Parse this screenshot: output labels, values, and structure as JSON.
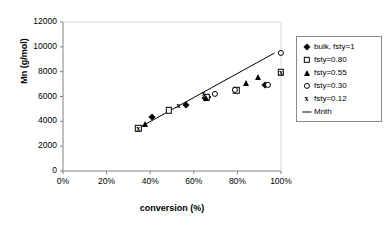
{
  "chart_data": {
    "type": "scatter",
    "title": "",
    "xlabel": "conversion (%)",
    "ylabel": "Mn (g/mol)",
    "xlim": [
      0,
      100
    ],
    "ylim": [
      0,
      12000
    ],
    "xticks": [
      "0%",
      "20%",
      "40%",
      "60%",
      "80%",
      "100%"
    ],
    "xtick_values": [
      0,
      20,
      40,
      60,
      80,
      100
    ],
    "yticks": [
      "0",
      "2000",
      "4000",
      "6000",
      "8000",
      "10000",
      "12000"
    ],
    "ytick_values": [
      0,
      2000,
      4000,
      6000,
      8000,
      10000,
      12000
    ],
    "grid": false,
    "legend_position": "right",
    "series": [
      {
        "name": "bulk, fsty=1",
        "marker": "filled-diamond",
        "points": [
          {
            "x": 41.0,
            "y": 4350
          },
          {
            "x": 56.5,
            "y": 5350
          },
          {
            "x": 65.0,
            "y": 5850
          },
          {
            "x": 66.5,
            "y": 6000
          },
          {
            "x": 92.5,
            "y": 6950
          }
        ]
      },
      {
        "name": "fsty=0.80",
        "marker": "open-square",
        "points": [
          {
            "x": 34.5,
            "y": 3450
          },
          {
            "x": 48.5,
            "y": 4900
          },
          {
            "x": 66.0,
            "y": 5950
          },
          {
            "x": 79.5,
            "y": 6500
          },
          {
            "x": 100.0,
            "y": 7950
          }
        ]
      },
      {
        "name": "fsty=0.55",
        "marker": "filled-triangle",
        "points": [
          {
            "x": 37.5,
            "y": 3800
          },
          {
            "x": 65.5,
            "y": 5900
          },
          {
            "x": 84.0,
            "y": 7050
          },
          {
            "x": 89.5,
            "y": 7600
          }
        ]
      },
      {
        "name": "fsty=0.30",
        "marker": "open-circle",
        "points": [
          {
            "x": 69.5,
            "y": 6200
          },
          {
            "x": 79.0,
            "y": 6550
          },
          {
            "x": 94.0,
            "y": 6950
          },
          {
            "x": 100.0,
            "y": 9500
          }
        ]
      },
      {
        "name": "fsty=0.12",
        "marker": "cross",
        "points": [
          {
            "x": 34.5,
            "y": 3400
          },
          {
            "x": 53.0,
            "y": 5250
          },
          {
            "x": 64.5,
            "y": 6200
          },
          {
            "x": 100.0,
            "y": 7900
          }
        ]
      }
    ],
    "trendline": {
      "name": "Mnth",
      "marker": "line",
      "x": [
        34.5,
        97.0
      ],
      "y": [
        3450,
        9500
      ]
    }
  },
  "legend": {
    "items": [
      {
        "label": "bulk, fsty=1",
        "marker": "filled-diamond"
      },
      {
        "label": "fsty=0.80",
        "marker": "open-square"
      },
      {
        "label": "fsty=0.55",
        "marker": "filled-triangle"
      },
      {
        "label": "fsty=0.30",
        "marker": "open-circle"
      },
      {
        "label": "fsty=0.12",
        "marker": "cross"
      },
      {
        "label": "Mnth",
        "marker": "line"
      }
    ]
  },
  "colors": {
    "ink": "#000000",
    "axis": "#808080",
    "background": "#ffffff"
  }
}
